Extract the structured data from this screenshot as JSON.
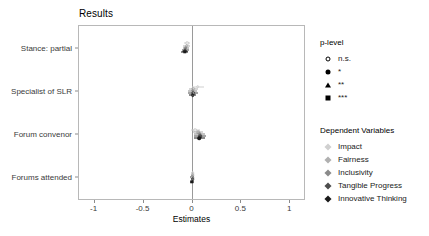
{
  "chart_data": {
    "type": "scatter",
    "title": "Results",
    "xlabel": "Estimates",
    "ylabel": "",
    "xlim": [
      -1.15,
      1.15
    ],
    "xticks": [
      -1,
      -0.5,
      0,
      0.5,
      1
    ],
    "xticklabels": [
      "-1",
      "-0.5",
      "0",
      "0.5",
      "1"
    ],
    "categories": [
      "Stance: partial",
      "Specialist of SLR",
      "Forum convenor",
      "Forums attended"
    ],
    "grid": false,
    "zero_reference_line": 0,
    "legend_position": "right",
    "series": [
      {
        "name": "Impact",
        "color": "#d0d0d0",
        "points": [
          {
            "category": "Stance: partial",
            "estimate": -0.055,
            "ci_low": -0.085,
            "ci_high": -0.025,
            "p_level": "n.s."
          },
          {
            "category": "Specialist of SLR",
            "estimate": 0.055,
            "ci_low": -0.01,
            "ci_high": 0.12,
            "p_level": "n.s."
          },
          {
            "category": "Forum convenor",
            "estimate": 0.03,
            "ci_low": -0.02,
            "ci_high": 0.08,
            "p_level": "n.s."
          },
          {
            "category": "Forums attended",
            "estimate": 0.0,
            "ci_low": -0.02,
            "ci_high": 0.02,
            "p_level": "n.s."
          }
        ]
      },
      {
        "name": "Fairness",
        "color": "#b0b0b0",
        "points": [
          {
            "category": "Stance: partial",
            "estimate": -0.06,
            "ci_low": -0.095,
            "ci_high": -0.025,
            "p_level": "n.s."
          },
          {
            "category": "Specialist of SLR",
            "estimate": 0.01,
            "ci_low": -0.04,
            "ci_high": 0.06,
            "p_level": "n.s."
          },
          {
            "category": "Forum convenor",
            "estimate": 0.06,
            "ci_low": 0.01,
            "ci_high": 0.11,
            "p_level": "*"
          },
          {
            "category": "Forums attended",
            "estimate": 0.0,
            "ci_low": -0.02,
            "ci_high": 0.02,
            "p_level": "n.s."
          }
        ]
      },
      {
        "name": "Inclusivity",
        "color": "#8a8a8a",
        "points": [
          {
            "category": "Stance: partial",
            "estimate": -0.07,
            "ci_low": -0.1,
            "ci_high": -0.04,
            "p_level": "*"
          },
          {
            "category": "Specialist of SLR",
            "estimate": 0.0,
            "ci_low": -0.045,
            "ci_high": 0.045,
            "p_level": "n.s."
          },
          {
            "category": "Forum convenor",
            "estimate": 0.075,
            "ci_low": 0.02,
            "ci_high": 0.13,
            "p_level": "*"
          },
          {
            "category": "Forums attended",
            "estimate": -0.005,
            "ci_low": -0.025,
            "ci_high": 0.015,
            "p_level": "n.s."
          }
        ]
      },
      {
        "name": "Tangible Progress",
        "color": "#4d4d4d",
        "points": [
          {
            "category": "Stance: partial",
            "estimate": -0.075,
            "ci_low": -0.11,
            "ci_high": -0.04,
            "p_level": "**"
          },
          {
            "category": "Specialist of SLR",
            "estimate": 0.005,
            "ci_low": -0.045,
            "ci_high": 0.055,
            "p_level": "n.s."
          },
          {
            "category": "Forum convenor",
            "estimate": 0.08,
            "ci_low": 0.02,
            "ci_high": 0.14,
            "p_level": "*"
          },
          {
            "category": "Forums attended",
            "estimate": 0.0,
            "ci_low": -0.02,
            "ci_high": 0.02,
            "p_level": "n.s."
          }
        ]
      },
      {
        "name": "Innovative Thinking",
        "color": "#1a1a1a",
        "points": [
          {
            "category": "Stance: partial",
            "estimate": -0.08,
            "ci_low": -0.115,
            "ci_high": -0.045,
            "p_level": "***"
          },
          {
            "category": "Specialist of SLR",
            "estimate": 0.0,
            "ci_low": -0.04,
            "ci_high": 0.04,
            "p_level": "n.s."
          },
          {
            "category": "Forum convenor",
            "estimate": 0.07,
            "ci_low": 0.015,
            "ci_high": 0.125,
            "p_level": "*"
          },
          {
            "category": "Forums attended",
            "estimate": -0.005,
            "ci_low": -0.025,
            "ci_high": 0.015,
            "p_level": "***"
          }
        ]
      }
    ],
    "legends": [
      {
        "title": "p-level",
        "items": [
          {
            "label": "n.s.",
            "shape": "circle-open"
          },
          {
            "label": "*",
            "shape": "circle-fill"
          },
          {
            "label": "**",
            "shape": "triangle"
          },
          {
            "label": "***",
            "shape": "square"
          }
        ]
      },
      {
        "title": "Dependent Variables",
        "items": [
          {
            "label": "Impact",
            "shape": "diamond",
            "color": "#d0d0d0"
          },
          {
            "label": "Fairness",
            "shape": "diamond",
            "color": "#b0b0b0"
          },
          {
            "label": "Inclusivity",
            "shape": "diamond",
            "color": "#8a8a8a"
          },
          {
            "label": "Tangible Progress",
            "shape": "diamond",
            "color": "#4d4d4d"
          },
          {
            "label": "Innovative Thinking",
            "shape": "diamond",
            "color": "#1a1a1a"
          }
        ]
      }
    ]
  }
}
